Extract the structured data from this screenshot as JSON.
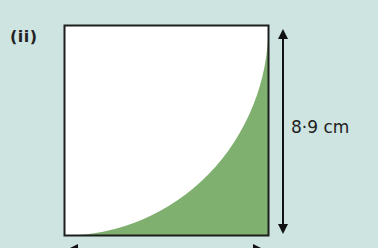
{
  "figure": {
    "part_label": "(ii)",
    "shape": "square",
    "shaded_region": "square minus quarter circle centered at top-left corner",
    "side_length_label": "8·9 cm",
    "side_length_value": 8.9,
    "side_length_unit": "cm"
  },
  "colors": {
    "background": "#cde4e1",
    "square_fill": "#ffffff",
    "shaded_fill": "#7fb06f",
    "outline": "#1e1e1e",
    "arrow": "#111111"
  }
}
